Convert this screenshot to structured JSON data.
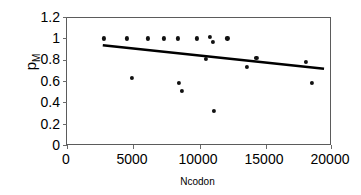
{
  "chart_data": {
    "type": "scatter",
    "title": "",
    "xlabel": "Ncodon",
    "ylabel": "p_M",
    "ylabel_text": "p",
    "ylabel_sub": "M",
    "xlim": [
      0,
      20000
    ],
    "ylim": [
      0,
      1.2
    ],
    "xticks": [
      0,
      5000,
      10000,
      15000,
      20000
    ],
    "xtick_labels": [
      "0",
      "5000",
      "10000",
      "15000",
      "20000"
    ],
    "yticks": [
      0,
      0.2,
      0.4,
      0.6,
      0.8,
      1,
      1.2
    ],
    "ytick_labels": [
      "0",
      "0.2",
      "0.4",
      "0.6",
      "0.8",
      "1",
      "1.2"
    ],
    "grid": false,
    "legend": null,
    "marker": "filled-circle",
    "marker_color": "#111111",
    "points": [
      {
        "x": 2800,
        "y": 1.0
      },
      {
        "x": 4500,
        "y": 1.0
      },
      {
        "x": 4900,
        "y": 0.63
      },
      {
        "x": 6100,
        "y": 1.0
      },
      {
        "x": 7300,
        "y": 1.0
      },
      {
        "x": 8400,
        "y": 1.0
      },
      {
        "x": 8450,
        "y": 0.58
      },
      {
        "x": 8650,
        "y": 0.51
      },
      {
        "x": 9800,
        "y": 1.0
      },
      {
        "x": 10500,
        "y": 0.81
      },
      {
        "x": 10800,
        "y": 1.01
      },
      {
        "x": 11000,
        "y": 0.97
      },
      {
        "x": 11100,
        "y": 0.32
      },
      {
        "x": 12100,
        "y": 1.0
      },
      {
        "x": 13600,
        "y": 0.73
      },
      {
        "x": 14300,
        "y": 0.815
      },
      {
        "x": 18000,
        "y": 0.78
      },
      {
        "x": 18500,
        "y": 0.58
      }
    ],
    "trendline": {
      "type": "linear-fit",
      "x_start": 2700,
      "y_start": 0.935,
      "x_end": 19400,
      "y_end": 0.715,
      "color": "#000000",
      "width": 2.6
    }
  }
}
